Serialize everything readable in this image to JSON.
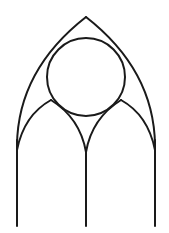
{
  "diagram": {
    "title": "",
    "stroke_color": "#1a1a1a",
    "background": "#ffffff",
    "elements": [
      {
        "type": "outer-arch",
        "apex": [
          86,
          17
        ],
        "springing_left": [
          17,
          140
        ],
        "springing_right": [
          155,
          140
        ]
      },
      {
        "type": "circle",
        "center": [
          86,
          77
        ],
        "radius": 39
      },
      {
        "type": "inner-arch-left",
        "from": [
          17,
          150
        ],
        "apex": [
          51,
          100
        ],
        "to": [
          86,
          152
        ]
      },
      {
        "type": "inner-arch-right",
        "from": [
          86,
          152
        ],
        "apex": [
          121,
          100
        ],
        "to": [
          155,
          150
        ]
      },
      {
        "type": "mullion-left",
        "x": 17,
        "y1": 140,
        "y2": 226
      },
      {
        "type": "mullion-center",
        "x": 86,
        "y1": 152,
        "y2": 226
      },
      {
        "type": "mullion-right",
        "x": 155,
        "y1": 140,
        "y2": 226
      }
    ]
  }
}
